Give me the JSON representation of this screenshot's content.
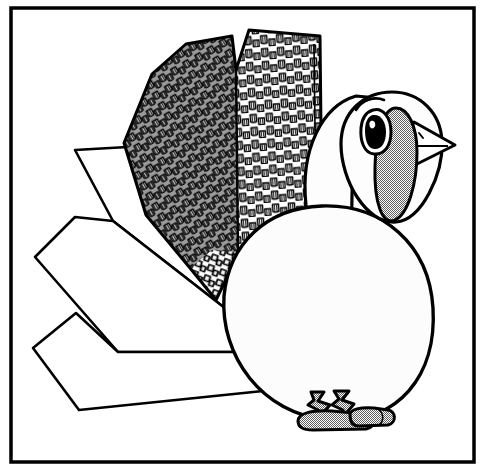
{
  "artwork": {
    "title": "Turkey",
    "subject": "turkey-bird-line-illustration",
    "style": "black-and-white line art with halftone shading",
    "canvas": {
      "width": 485,
      "height": 469
    },
    "caption": ""
  },
  "colors": {
    "ink": "#000000",
    "paper": "#ffffff",
    "halftone_grey": "#a8a8a8",
    "feather_fill_light": "#f2f2f2",
    "feather_fill_mid": "#b5b5b5",
    "body_fill": "#fbfbfb",
    "tail_fill": "#ffffff"
  },
  "frame": {
    "name": "border-rectangle",
    "x": 11,
    "y": 8,
    "width": 463,
    "height": 454,
    "stroke_width": 3.5
  },
  "parts": [
    {
      "id": "tail-fan",
      "label": "Tail fan",
      "feathers": 3
    },
    {
      "id": "wing",
      "label": "Wing",
      "panels": 2
    },
    {
      "id": "body",
      "label": "Body"
    },
    {
      "id": "neck",
      "label": "Neck"
    },
    {
      "id": "head",
      "label": "Head"
    },
    {
      "id": "eye",
      "label": "Eye"
    },
    {
      "id": "brow",
      "label": "Brow"
    },
    {
      "id": "beak",
      "label": "Beak"
    },
    {
      "id": "wattle",
      "label": "Wattle"
    },
    {
      "id": "legs",
      "label": "Legs",
      "count": 2
    },
    {
      "id": "feet",
      "label": "Feet",
      "count": 2
    }
  ],
  "geometry": {
    "tail_feather_upper": "M 75,150 L 113,221 L 257,332 L 248,255 L 145,146 Z",
    "tail_feather_middle": "M 35,257 L 75,217 L 113,221 L 257,332 L 300,352 L 78,352 Z",
    "tail_feather_lower": "M 33,348 L 74,314 L 113,326 L 300,352 L 290,390 L 78,410 Z",
    "body": "M 225,292 C 215,352 256,412 322,420 C 398,428 436,374 431,310 C 427,248 382,205 322,207 C 267,209 232,243 225,292 Z",
    "neck": "M 305,191 C 303,139 328,103 361,95 L 400,100 L 402,196 L 352,213 Z",
    "head": "M 345,142 C 345,112 368,92 393,93 C 420,93 440,112 441,140 C 442,172 420,218 396,220 C 368,222 345,178 345,142 Z",
    "wattle": "M 392,112 C 404,110 414,126 414,150 C 414,180 406,210 394,216 C 382,221 373,200 374,166 C 375,135 381,114 392,112 Z",
    "beak": "M 416,125 L 453,144 L 418,162 C 410,152 410,136 416,125 Z",
    "eye_outer": "M 372,112 C 381,108 390,117 390,130 C 390,144 383,153 374,152 C 366,151 361,140 362,128 C 363,119 366,114 372,112 Z",
    "brow": "M 358,109 C 364,101 375,98 384,101",
    "leg_left": "M 312,393 L 322,393 L 331,406 L 327,420 L 315,420 L 311,406 Z",
    "leg_right": "M 336,392 L 348,392 L 356,407 L 351,420 L 340,420 L 334,407 Z",
    "foot_left": "M 299,419 C 299,412 312,410 330,411 L 366,414 C 376,415 378,425 368,427 L 312,429 C 302,429 299,425 299,419 Z",
    "foot_right": "M 352,414 C 352,409 362,407 374,408 L 389,410 C 396,411 397,422 389,424 L 360,425 C 354,425 352,420 352,414 Z",
    "wing_outline": "M 152,74 L 186,44 L 232,36 L 235,68 L 249,30 L 320,36 L 322,222 L 236,259 L 216,300 L 190,268 L 146,215 L 124,143 Z",
    "wing_panel_split": "M 235,68 L 238,252"
  },
  "texture": {
    "feather_scale_rows": 26,
    "feather_scale_cols_left": 14,
    "feather_scale_cols_right": 12,
    "halftone_cell_px": 2
  },
  "accessibility": {
    "alt": "Black and white line drawing of a turkey facing right inside a rectangular border. The turkey has a round body, a fanned tail of three large plain feathers on the left, a textured wing of overlapping scale-like feathers, a head with an eye, a pointed beak and a shaded wattle, and two shaded legs standing on oval feet."
  }
}
